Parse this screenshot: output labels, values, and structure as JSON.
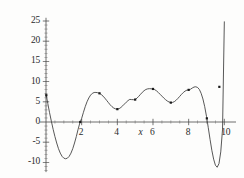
{
  "chart_data": {
    "type": "line",
    "title": "",
    "subtitle": "",
    "xlabel": "x",
    "ylabel": "",
    "xlim": [
      0,
      10.15
    ],
    "ylim": [
      -13,
      25.8
    ],
    "grid": false,
    "legend": null,
    "x_ticks": [
      2,
      4,
      6,
      8,
      10
    ],
    "x_tick_labels": [
      "2",
      "4",
      "6",
      "8",
      "10"
    ],
    "x_minor_tick_step": 0.5,
    "y_ticks": [
      -10,
      -5,
      0,
      5,
      10,
      15,
      20,
      25
    ],
    "y_tick_labels": [
      "-10",
      "-5",
      "0",
      "5",
      "10",
      "15",
      "20",
      "25"
    ],
    "y_minor_tick_step": 1,
    "line_color": "#3a3a3a",
    "marker_color": "#1a1a1a",
    "axis_color": "#4a4a4a",
    "background_color": "#fdfdfc",
    "series": [
      {
        "name": "curve",
        "x": [
          0.0,
          0.1,
          0.2,
          0.3,
          0.4,
          0.5,
          0.6,
          0.7,
          0.8,
          0.9,
          1.0,
          1.1,
          1.2,
          1.3,
          1.4,
          1.5,
          1.6,
          1.7,
          1.8,
          1.9,
          2.0,
          2.1,
          2.2,
          2.3,
          2.4,
          2.5,
          2.6,
          2.7,
          2.8,
          2.9,
          3.0,
          3.1,
          3.2,
          3.3,
          3.4,
          3.5,
          3.6,
          3.7,
          3.8,
          3.9,
          4.0,
          4.1,
          4.2,
          4.3,
          4.4,
          4.5,
          4.6,
          4.7,
          4.8,
          4.9,
          5.0,
          5.1,
          5.2,
          5.3,
          5.4,
          5.5,
          5.6,
          5.7,
          5.8,
          5.9,
          6.0,
          6.1,
          6.2,
          6.3,
          6.4,
          6.5,
          6.6,
          6.7,
          6.8,
          6.9,
          7.0,
          7.1,
          7.2,
          7.3,
          7.4,
          7.5,
          7.6,
          7.7,
          7.8,
          7.9,
          8.0,
          8.1,
          8.2,
          8.3,
          8.4,
          8.5,
          8.6,
          8.7,
          8.8,
          8.9,
          9.0,
          9.1,
          9.2,
          9.3,
          9.4,
          9.5,
          9.6,
          9.7,
          9.8,
          9.9,
          10.0
        ],
        "y": [
          7.0,
          4.6,
          2.3,
          0.2,
          -1.8,
          -3.6,
          -5.2,
          -6.6,
          -7.7,
          -8.5,
          -8.95,
          -9.1,
          -8.95,
          -8.5,
          -7.7,
          -6.6,
          -5.2,
          -3.6,
          -1.8,
          -0.2,
          0.9,
          2.4,
          3.8,
          5.0,
          5.95,
          6.65,
          7.1,
          7.3,
          7.32,
          7.25,
          7.1,
          6.8,
          6.4,
          5.9,
          5.35,
          4.8,
          4.25,
          3.8,
          3.45,
          3.25,
          3.18,
          3.3,
          3.6,
          4.0,
          4.45,
          4.9,
          5.3,
          5.6,
          5.55,
          5.52,
          5.55,
          5.9,
          6.35,
          6.85,
          7.35,
          7.75,
          8.05,
          8.2,
          8.25,
          8.22,
          8.18,
          8.0,
          7.7,
          7.3,
          6.85,
          6.4,
          5.95,
          5.55,
          5.2,
          4.95,
          4.8,
          4.85,
          5.05,
          5.4,
          5.85,
          6.35,
          6.85,
          7.3,
          7.65,
          7.88,
          7.95,
          8.1,
          8.4,
          8.65,
          8.72,
          8.55,
          8.05,
          7.1,
          5.7,
          3.8,
          1.4,
          -1.4,
          -4.3,
          -7.0,
          -9.2,
          -10.7,
          -11.2,
          -10.3,
          -7.4,
          -1.8,
          24.8
        ]
      }
    ],
    "markers": [
      {
        "x": 1.92,
        "y": 0.0
      },
      {
        "x": 3.0,
        "y": 7.1
      },
      {
        "x": 4.0,
        "y": 3.18
      },
      {
        "x": 5.0,
        "y": 5.55
      },
      {
        "x": 6.0,
        "y": 8.18
      },
      {
        "x": 7.0,
        "y": 4.8
      },
      {
        "x": 8.0,
        "y": 7.95
      },
      {
        "x": 9.02,
        "y": 0.9
      },
      {
        "x": 9.72,
        "y": 8.7
      },
      {
        "x": 0.02,
        "y": 6.6
      }
    ]
  }
}
